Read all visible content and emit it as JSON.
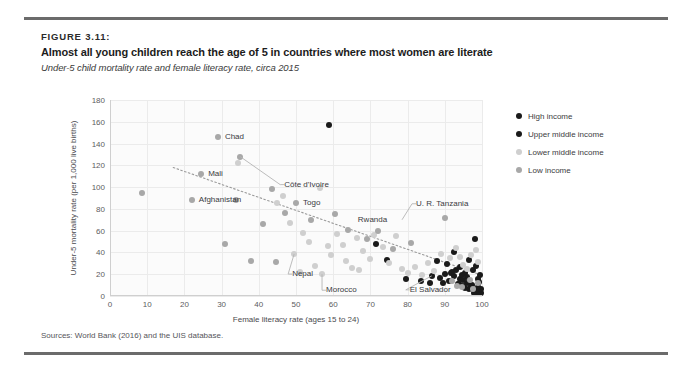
{
  "figure": {
    "label": "FIGURE 3.11:",
    "title": "Almost all young children reach the age of 5 in countries where most women are literate",
    "subtitle": "Under-5 child mortality rate and female literacy rate, circa 2015",
    "source": "Sources: World Bank (2016) and the UIS database."
  },
  "colors": {
    "high_income": "#1a1a1a",
    "upper_middle_income": "#1a1a1a",
    "lower_middle_income": "#cfcfcf",
    "low_income": "#a8a8a8",
    "trendline": "#9a9a9a",
    "grid": "#ebebeb",
    "rule": "#6b6b6b"
  },
  "chart_data": {
    "type": "scatter",
    "title": "Almost all young children reach the age of 5 in countries where most women are literate",
    "subtitle": "Under-5 child mortality rate and female literacy rate, circa 2015",
    "xlabel": "Female literacy rate (ages 15 to 24)",
    "ylabel": "Under-5 mortality rate (per 1,000 live births)",
    "xlim": [
      0,
      100
    ],
    "ylim": [
      0,
      180
    ],
    "xticks": [
      0,
      10,
      20,
      30,
      40,
      50,
      60,
      70,
      80,
      90,
      100
    ],
    "yticks": [
      0,
      20,
      40,
      60,
      80,
      100,
      120,
      140,
      160,
      180
    ],
    "grid": true,
    "legend_position": "right",
    "trendline": {
      "type": "linear-dotted",
      "x0": 17,
      "y0": 118,
      "x1": 100,
      "y1": 19
    },
    "series": [
      {
        "name": "High income",
        "color": "#1a1a1a",
        "points": [
          {
            "x": 99.4,
            "y": 3.5
          },
          {
            "x": 99.0,
            "y": 4.0
          },
          {
            "x": 98.6,
            "y": 3.2
          },
          {
            "x": 99.8,
            "y": 2.8
          },
          {
            "x": 98.2,
            "y": 4.5
          },
          {
            "x": 97.8,
            "y": 3.0
          },
          {
            "x": 99.2,
            "y": 5.5
          },
          {
            "x": 96.5,
            "y": 6.0
          },
          {
            "x": 95.5,
            "y": 7.5
          },
          {
            "x": 94.8,
            "y": 9.0
          },
          {
            "x": 93.5,
            "y": 11.0
          },
          {
            "x": 99.6,
            "y": 6.8
          },
          {
            "x": 98.9,
            "y": 8.0
          },
          {
            "x": 97.2,
            "y": 10.5
          },
          {
            "x": 96.0,
            "y": 12.0
          },
          {
            "x": 99.1,
            "y": 13.0
          },
          {
            "x": 94.0,
            "y": 16.0
          },
          {
            "x": 92.5,
            "y": 18.0
          },
          {
            "x": 99.5,
            "y": 19.5
          },
          {
            "x": 91.8,
            "y": 21.0
          }
        ]
      },
      {
        "name": "Upper middle income",
        "color": "#1a1a1a",
        "points": [
          {
            "x": 59.0,
            "y": 157.0
          },
          {
            "x": 71.5,
            "y": 48.0
          },
          {
            "x": 74.5,
            "y": 33.0
          },
          {
            "x": 79.5,
            "y": 15.5
          },
          {
            "x": 83.5,
            "y": 14.0
          },
          {
            "x": 86.5,
            "y": 18.5
          },
          {
            "x": 88.0,
            "y": 32.0
          },
          {
            "x": 90.5,
            "y": 29.5
          },
          {
            "x": 92.5,
            "y": 40.0
          },
          {
            "x": 93.0,
            "y": 24.0
          },
          {
            "x": 95.5,
            "y": 21.0
          },
          {
            "x": 96.5,
            "y": 33.5
          },
          {
            "x": 98.0,
            "y": 52.0
          },
          {
            "x": 98.5,
            "y": 28.0
          },
          {
            "x": 88.8,
            "y": 16.5
          },
          {
            "x": 91.0,
            "y": 13.5
          },
          {
            "x": 93.8,
            "y": 11.0
          },
          {
            "x": 96.0,
            "y": 17.0
          },
          {
            "x": 97.5,
            "y": 23.5
          },
          {
            "x": 94.5,
            "y": 19.0
          },
          {
            "x": 92.0,
            "y": 22.5
          },
          {
            "x": 95.0,
            "y": 14.5
          },
          {
            "x": 89.5,
            "y": 11.5
          },
          {
            "x": 97.0,
            "y": 9.0
          },
          {
            "x": 99.0,
            "y": 16.0
          },
          {
            "x": 90.0,
            "y": 20.5
          },
          {
            "x": 94.0,
            "y": 26.5
          },
          {
            "x": 86.0,
            "y": 12.0
          }
        ]
      },
      {
        "name": "Lower middle income",
        "color": "#cfcfcf",
        "points": [
          {
            "x": 34.5,
            "y": 122.0
          },
          {
            "x": 45.0,
            "y": 85.0
          },
          {
            "x": 46.5,
            "y": 92.0
          },
          {
            "x": 48.5,
            "y": 67.0
          },
          {
            "x": 52.0,
            "y": 58.0
          },
          {
            "x": 53.5,
            "y": 50.0
          },
          {
            "x": 55.0,
            "y": 28.0
          },
          {
            "x": 56.5,
            "y": 99.0
          },
          {
            "x": 58.5,
            "y": 46.0
          },
          {
            "x": 59.5,
            "y": 37.5
          },
          {
            "x": 61.0,
            "y": 57.0
          },
          {
            "x": 62.5,
            "y": 46.5
          },
          {
            "x": 63.5,
            "y": 32.0
          },
          {
            "x": 65.0,
            "y": 26.0
          },
          {
            "x": 66.5,
            "y": 53.0
          },
          {
            "x": 68.0,
            "y": 41.0
          },
          {
            "x": 70.0,
            "y": 34.0
          },
          {
            "x": 71.0,
            "y": 56.0
          },
          {
            "x": 73.5,
            "y": 45.0
          },
          {
            "x": 75.0,
            "y": 30.5
          },
          {
            "x": 77.0,
            "y": 55.0
          },
          {
            "x": 78.5,
            "y": 25.0
          },
          {
            "x": 80.0,
            "y": 21.5
          },
          {
            "x": 82.0,
            "y": 27.0
          },
          {
            "x": 84.0,
            "y": 19.0
          },
          {
            "x": 85.5,
            "y": 30.0
          },
          {
            "x": 87.0,
            "y": 23.0
          },
          {
            "x": 89.0,
            "y": 39.0
          },
          {
            "x": 91.5,
            "y": 34.5
          },
          {
            "x": 93.0,
            "y": 44.0
          },
          {
            "x": 95.0,
            "y": 28.5
          },
          {
            "x": 97.0,
            "y": 38.0
          },
          {
            "x": 98.5,
            "y": 42.0
          },
          {
            "x": 99.0,
            "y": 31.0
          },
          {
            "x": 96.0,
            "y": 24.5
          },
          {
            "x": 94.0,
            "y": 36.0
          },
          {
            "x": 49.5,
            "y": 38.5
          },
          {
            "x": 51.0,
            "y": 22.5
          },
          {
            "x": 57.0,
            "y": 20.0
          },
          {
            "x": 67.0,
            "y": 23.5
          }
        ]
      },
      {
        "name": "Low income",
        "color": "#a8a8a8",
        "points": [
          {
            "x": 8.5,
            "y": 95.0
          },
          {
            "x": 22.0,
            "y": 88.0
          },
          {
            "x": 24.5,
            "y": 112.0
          },
          {
            "x": 29.0,
            "y": 146.0
          },
          {
            "x": 31.0,
            "y": 48.0
          },
          {
            "x": 34.0,
            "y": 88.0
          },
          {
            "x": 35.0,
            "y": 128.0
          },
          {
            "x": 38.0,
            "y": 32.0
          },
          {
            "x": 41.0,
            "y": 66.0
          },
          {
            "x": 43.5,
            "y": 98.0
          },
          {
            "x": 44.5,
            "y": 31.0
          },
          {
            "x": 47.0,
            "y": 76.0
          },
          {
            "x": 50.0,
            "y": 85.0
          },
          {
            "x": 54.0,
            "y": 70.0
          },
          {
            "x": 60.5,
            "y": 75.0
          },
          {
            "x": 64.0,
            "y": 61.0
          },
          {
            "x": 69.0,
            "y": 52.0
          },
          {
            "x": 72.0,
            "y": 60.0
          },
          {
            "x": 76.0,
            "y": 43.0
          },
          {
            "x": 81.0,
            "y": 49.0
          },
          {
            "x": 90.0,
            "y": 72.0
          },
          {
            "x": 92.0,
            "y": 14.0
          },
          {
            "x": 94.5,
            "y": 8.0
          },
          {
            "x": 97.5,
            "y": 6.0
          },
          {
            "x": 99.0,
            "y": 11.5
          },
          {
            "x": 96.8,
            "y": 15.0
          },
          {
            "x": 93.2,
            "y": 9.5
          }
        ]
      }
    ],
    "annotations": [
      {
        "label": "Chad",
        "x": 29.0,
        "y": 146.0,
        "dx": 7,
        "dy": 0,
        "leader": false
      },
      {
        "label": "Mali",
        "x": 24.5,
        "y": 112.0,
        "dx": 7,
        "dy": 0,
        "leader": false
      },
      {
        "label": "Côte d'Ivoire",
        "x": 35.0,
        "y": 128.0,
        "dx": 44,
        "dy": 28,
        "leader": true
      },
      {
        "label": "Afghanistan",
        "x": 22.0,
        "y": 88.0,
        "dx": 7,
        "dy": 0,
        "leader": false
      },
      {
        "label": "Togo",
        "x": 50.0,
        "y": 85.0,
        "dx": 7,
        "dy": 0,
        "leader": false
      },
      {
        "label": "Nepal",
        "x": 49.5,
        "y": 38.5,
        "dx": -2,
        "dy": 20,
        "leader": true
      },
      {
        "label": "Morocco",
        "x": 57.0,
        "y": 20.0,
        "dx": 4,
        "dy": 16,
        "leader": true
      },
      {
        "label": "Rwanda",
        "x": 72.0,
        "y": 60.0,
        "dx": -20,
        "dy": -11,
        "leader": false
      },
      {
        "label": "U. R. Tanzania",
        "x": 78.5,
        "y": 70.0,
        "dx": 14,
        "dy": -16,
        "leader": true
      },
      {
        "label": "El Salvador",
        "x": 86.5,
        "y": 18.5,
        "dx": -22,
        "dy": 14,
        "leader": true
      }
    ]
  },
  "legend": {
    "items": [
      {
        "label": "High income",
        "color": "#1a1a1a"
      },
      {
        "label": "Upper middle income",
        "color": "#1a1a1a"
      },
      {
        "label": "Lower middle income",
        "color": "#cfcfcf"
      },
      {
        "label": "Low income",
        "color": "#a8a8a8"
      }
    ]
  }
}
